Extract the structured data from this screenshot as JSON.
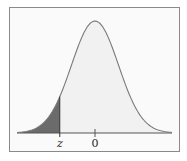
{
  "chart_data": {
    "type": "area",
    "title": "",
    "xlabel": "",
    "ylabel": "",
    "x_ticks": [
      {
        "label": "z",
        "value": -1.5
      },
      {
        "label": "0",
        "value": 0
      }
    ],
    "distribution": {
      "mean": 0,
      "sd": 1
    },
    "shaded_region": {
      "from": "-inf",
      "to": "z",
      "approx_z": -1.5
    },
    "xlim": [
      -3.5,
      3.5
    ],
    "grid": false,
    "legend": null
  },
  "labels": {
    "z": "z",
    "zero": "0"
  },
  "colors": {
    "shade": "#6b6b6b",
    "curve": "#7a7a7a",
    "fill": "#f1f1f1",
    "axis": "#555555",
    "frame": "#8a8a8a"
  }
}
